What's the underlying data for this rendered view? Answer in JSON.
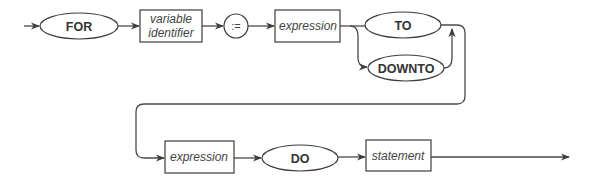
{
  "diagram": {
    "type": "syntax-diagram",
    "nodes": [
      {
        "id": "for",
        "kind": "keyword",
        "label": "FOR"
      },
      {
        "id": "varid",
        "kind": "nonterminal",
        "label_line1": "variable",
        "label_line2": "identifier"
      },
      {
        "id": "assign",
        "kind": "operator",
        "label": ":="
      },
      {
        "id": "expr1",
        "kind": "nonterminal",
        "label": "expression"
      },
      {
        "id": "to",
        "kind": "keyword",
        "label": "TO"
      },
      {
        "id": "downto",
        "kind": "keyword",
        "label": "DOWNTO"
      },
      {
        "id": "expr2",
        "kind": "nonterminal",
        "label": "expression"
      },
      {
        "id": "do",
        "kind": "keyword",
        "label": "DO"
      },
      {
        "id": "stmt",
        "kind": "nonterminal",
        "label": "statement"
      }
    ],
    "edges": [
      [
        "start",
        "for"
      ],
      [
        "for",
        "varid"
      ],
      [
        "varid",
        "assign"
      ],
      [
        "assign",
        "expr1"
      ],
      [
        "expr1",
        "to"
      ],
      [
        "expr1",
        "downto"
      ],
      [
        "to",
        "expr2"
      ],
      [
        "downto",
        "expr2"
      ],
      [
        "expr2",
        "do"
      ],
      [
        "do",
        "stmt"
      ],
      [
        "stmt",
        "end"
      ]
    ],
    "colors": {
      "line": "#4a4a4a",
      "text": "#333333",
      "background": "#ffffff"
    }
  },
  "labels": {
    "for": "FOR",
    "varid_1": "variable",
    "varid_2": "identifier",
    "assign": ":=",
    "expr1": "expression",
    "to": "TO",
    "downto": "DOWNTO",
    "expr2": "expression",
    "do": "DO",
    "stmt": "statement"
  }
}
